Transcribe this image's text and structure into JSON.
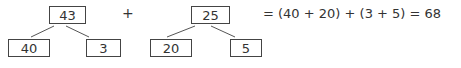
{
  "tree_left": {
    "root": "43",
    "left_child": "40",
    "right_child": "3"
  },
  "operator": "+",
  "tree_right": {
    "root": "25",
    "left_child": "20",
    "right_child": "5"
  },
  "equation": "= (40 + 20) + (3 + 5) = 68",
  "colors": {
    "stroke": "#444444",
    "text": "#333333",
    "background": "#ffffff"
  }
}
